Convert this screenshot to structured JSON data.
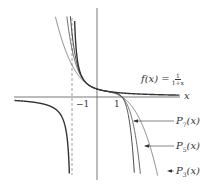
{
  "chart_data": {
    "type": "line",
    "title": "",
    "xlabel": "x",
    "ylabel": "",
    "xlim": [
      -3.9,
      4.8
    ],
    "ylim": [
      -11,
      12
    ],
    "grid": false,
    "legend_position": "right (callout labels with arrows)",
    "x_ticks": [
      -1,
      1
    ],
    "x_tick_labels": [
      "−1",
      "1"
    ],
    "asymptote": {
      "x": -1,
      "style": "dashed"
    },
    "series": [
      {
        "name": "f(x) = 1/(1+x)",
        "formula": "1/(1+x)",
        "style": "bold"
      },
      {
        "name": "P3(x)",
        "formula": "1 - x + x^2 - x^3",
        "degree": 3
      },
      {
        "name": "P5(x)",
        "formula": "1 - x + x^2 - x^3 + x^4 - x^5",
        "degree": 5
      },
      {
        "name": "P7(x)",
        "formula": "1 - x + x^2 - x^3 + x^4 - x^5 + x^6 - x^7",
        "degree": 7
      }
    ],
    "annotations": [
      "f(x) = 1/(1+x)",
      "P7(x)",
      "P5(x)",
      "P3(x)"
    ]
  },
  "labels": {
    "f_lhs": "f(x) =",
    "f_num": "1",
    "f_den": "1+x",
    "x_axis": "x",
    "tick_neg1": "−1",
    "tick_1": "1",
    "p7_main": "P",
    "p7_sub": "7",
    "p7_arg": "(x)",
    "p5_main": "P",
    "p5_sub": "5",
    "p5_arg": "(x)",
    "p3_main": "P",
    "p3_sub": "3",
    "p3_arg": "(x)"
  },
  "colors": {
    "axis": "#555555",
    "curve": "#333333",
    "background": "#ffffff"
  }
}
